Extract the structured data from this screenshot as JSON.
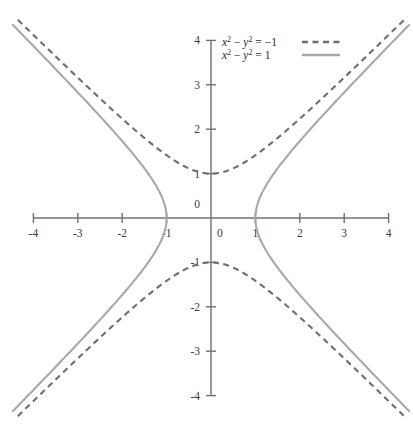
{
  "chart_data": {
    "type": "line",
    "title": "",
    "xlabel": "",
    "ylabel": "",
    "xlim": [
      -4,
      4
    ],
    "ylim": [
      -4,
      4
    ],
    "grid": false,
    "legend_position": "top-right",
    "xticks": [
      -4,
      -3,
      -2,
      -1,
      0,
      1,
      2,
      3,
      4
    ],
    "xtick_labels": [
      "-4",
      "-3",
      "-2",
      "-1",
      "0",
      "1",
      "2",
      "3",
      "4"
    ],
    "yticks": [
      -4,
      -3,
      -2,
      -1,
      0,
      1,
      2,
      3,
      4
    ],
    "ytick_labels": [
      "-4",
      "-3",
      "-2",
      "-1",
      "0",
      "1",
      "2",
      "3",
      "4"
    ],
    "origin_x_label": "0",
    "origin_y_label": "0",
    "series": [
      {
        "name": "x^2 - y^2 = -1",
        "legend_lhs_base": "x",
        "legend_lhs_exp1": "2",
        "legend_lhs_minus": " − ",
        "legend_var2": "y",
        "legend_exp2": "2",
        "legend_rhs": " = −1",
        "style": "dashed",
        "color": "#6e6e6e",
        "dash_pattern": "6,4.5",
        "equation": "x^2 - y^2 = -1",
        "vertices": [
          [
            0,
            1
          ],
          [
            0,
            -1
          ]
        ],
        "opens": "vertical",
        "asymptotes": [
          "y = x",
          "y = -x"
        ],
        "branch_upper_points": [
          [
            -4,
            4.123
          ],
          [
            -3,
            3.162
          ],
          [
            -2,
            2.236
          ],
          [
            -1,
            1.414
          ],
          [
            0,
            1
          ],
          [
            1,
            1.414
          ],
          [
            2,
            2.236
          ],
          [
            3,
            3.162
          ],
          [
            4,
            4.123
          ]
        ],
        "branch_lower_points": [
          [
            -4,
            -4.123
          ],
          [
            -3,
            -3.162
          ],
          [
            -2,
            -2.236
          ],
          [
            -1,
            -1.414
          ],
          [
            0,
            -1
          ],
          [
            1,
            -1.414
          ],
          [
            2,
            -2.236
          ],
          [
            3,
            -3.162
          ],
          [
            4,
            -4.123
          ]
        ]
      },
      {
        "name": "x^2 - y^2 = 1",
        "legend_lhs_base": "x",
        "legend_lhs_exp1": "2",
        "legend_lhs_minus": " − ",
        "legend_var2": "y",
        "legend_exp2": "2",
        "legend_rhs": " = 1",
        "style": "solid",
        "color": "#a8a8a8",
        "dash_pattern": "",
        "equation": "x^2 - y^2 = 1",
        "vertices": [
          [
            1,
            0
          ],
          [
            -1,
            0
          ]
        ],
        "opens": "horizontal",
        "asymptotes": [
          "y = x",
          "y = -x"
        ],
        "branch_right_points": [
          [
            1,
            0
          ],
          [
            1.414,
            1
          ],
          [
            2.236,
            2
          ],
          [
            3.162,
            3
          ],
          [
            4.123,
            4
          ]
        ],
        "branch_left_points": [
          [
            -1,
            0
          ],
          [
            -1.414,
            1
          ],
          [
            -2.236,
            2
          ],
          [
            -3.162,
            3
          ],
          [
            -4.123,
            4
          ]
        ]
      }
    ]
  },
  "geometry": {
    "origin_px_x": 211,
    "origin_px_y": 218,
    "unit_px": 44.4,
    "axis_half_extent": 4.0,
    "tick_len_px": 5
  },
  "legend": {
    "x_px": 222,
    "y_px": 42,
    "row_gap_px": 13,
    "sample_x_start": 302,
    "sample_x_end": 340
  },
  "colors": {
    "background": "#ffffff",
    "axis": "#707070",
    "tick_text": "#3a3a3a",
    "legend_text": "#2c2c2c",
    "dashed_curve": "#6e6e6e",
    "solid_curve": "#a8a8a8"
  }
}
